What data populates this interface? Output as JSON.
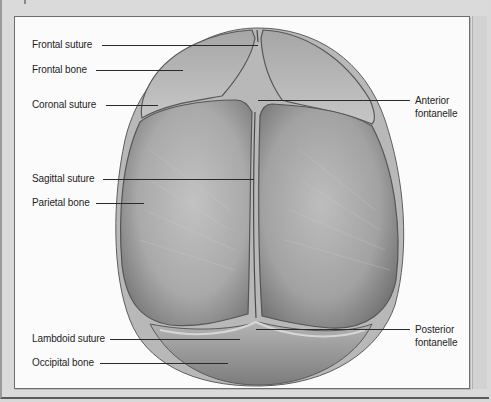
{
  "figure": {
    "type": "anatomical illustration",
    "colors": {
      "background": "#d8d8d8",
      "panel": "#fbfbfb",
      "bone": "#a8a8a8",
      "suture": "#555555",
      "text": "#1f1f1f"
    }
  },
  "labels": {
    "left": [
      {
        "text": "Frontal suture",
        "y": 38,
        "line_end": 258
      },
      {
        "text": "Frontal bone",
        "y": 63,
        "line_end": 183
      },
      {
        "text": "Coronal suture",
        "y": 98,
        "line_end": 158
      },
      {
        "text": "Sagittal suture",
        "y": 172,
        "line_end": 254
      },
      {
        "text": "Parietal bone",
        "y": 196,
        "line_end": 144
      },
      {
        "text": "Lambdoid suture",
        "y": 332,
        "line_end": 240
      },
      {
        "text": "Occipital bone",
        "y": 356,
        "line_end": 228
      }
    ],
    "right": [
      {
        "line1": "Anterior",
        "line2": "fontanelle",
        "y": 94,
        "line_start": 258
      },
      {
        "line1": "Posterior",
        "line2": "fontanelle",
        "y": 323,
        "line_start": 256
      }
    ]
  }
}
